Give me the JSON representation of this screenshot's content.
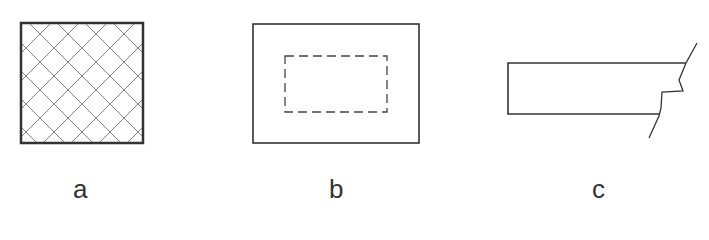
{
  "figures": [
    {
      "id": "a",
      "label": "a",
      "description": "Square with diagonal cross-hatching"
    },
    {
      "id": "b",
      "label": "b",
      "description": "Rectangle with inner dashed rectangle"
    },
    {
      "id": "c",
      "label": "c",
      "description": "Rectangle with broken (break-line) right end"
    }
  ],
  "colors": {
    "stroke": "#333333",
    "hatch": "#777777",
    "background": "#ffffff"
  }
}
